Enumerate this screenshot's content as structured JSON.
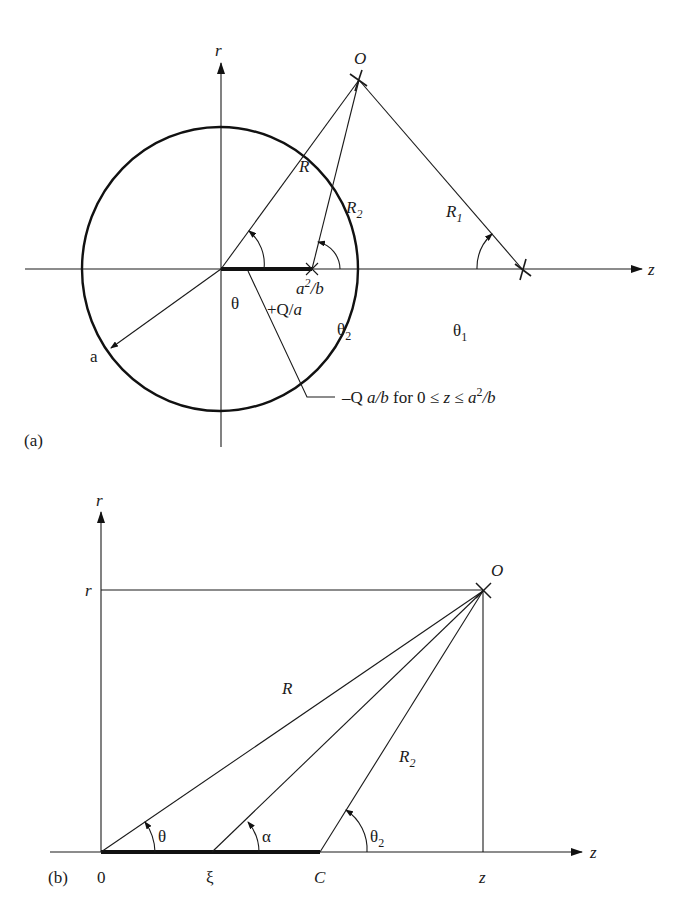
{
  "figure_a": {
    "panel_label": "(a)",
    "axis_r_label": "r",
    "axis_z_label": "z",
    "point_O_label": "O",
    "line_R_label": "R",
    "line_R2_label": "R",
    "line_R2_sub": "2",
    "line_R1_label": "R",
    "line_R1_sub": "1",
    "angle_theta_label": "θ",
    "angle_theta2_label": "θ",
    "angle_theta2_sub": "2",
    "angle_theta1_label": "θ",
    "angle_theta1_sub": "1",
    "charge_label": "+Q/",
    "charge_label_ital": "a",
    "image_point_label_a": "a",
    "image_point_label_sup": "2",
    "image_point_label_b": "/b",
    "radius_label": "a",
    "line_charge_annotation": {
      "prefix": "–Q ",
      "ital1": "a/b",
      "mid": " for 0 ≤ ",
      "ital2": "z",
      "mid2": " ≤ ",
      "ital3": "a",
      "sup": "2",
      "ital4": "/b"
    }
  },
  "figure_b": {
    "panel_label": "(b)",
    "axis_r_label": "r",
    "axis_z_label": "z",
    "r_level_label": "r",
    "point_O_label": "O",
    "line_R_label": "R",
    "line_R2_label": "R",
    "line_R2_sub": "2",
    "angle_theta_label": "θ",
    "angle_alpha_label": "α",
    "angle_theta2_label": "θ",
    "angle_theta2_sub": "2",
    "tick_0_label": "0",
    "tick_xi_label": "ξ",
    "tick_C_label": "C",
    "tick_z_label": "z"
  }
}
